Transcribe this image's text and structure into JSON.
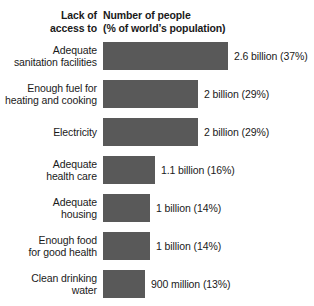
{
  "chart_data": {
    "type": "bar",
    "title": "",
    "orientation": "horizontal",
    "xlabel": "",
    "ylabel": "",
    "grid": false,
    "legend": null,
    "header_left_lines": [
      "Lack of",
      "access to"
    ],
    "header_right_lines": [
      "Number of people",
      "(% of world’s population)"
    ],
    "bar_color": "#595959",
    "background_color": "#ffffff",
    "xlim": [
      0,
      37
    ],
    "categories": [
      "Adequate sanitation facilities",
      "Enough fuel for heating and cooking",
      "Electricity",
      "Adequate health care",
      "Adequate housing",
      "Enough food for good health",
      "Clean drinking water"
    ],
    "values": [
      37,
      29,
      29,
      16,
      14,
      14,
      13
    ],
    "value_labels": [
      "2.6 billion (37%)",
      "2 billion (29%)",
      "2 billion (29%)",
      "1.1 billion (16%)",
      "1 billion (14%)",
      "1 billion (14%)",
      "900 million (13%)"
    ],
    "counts_billions": [
      2.6,
      2,
      2,
      1.1,
      1,
      1,
      0.9
    ]
  },
  "rows": [
    {
      "label_lines": [
        "Adequate",
        "sanitation facilities"
      ],
      "value": "2.6 billion (37%)",
      "percent": 37,
      "bar_width": 125,
      "value_left": 234
    },
    {
      "label_lines": [
        "Enough fuel for",
        "heating and cooking"
      ],
      "value": "2 billion (29%)",
      "percent": 29,
      "bar_width": 95,
      "value_left": 204
    },
    {
      "label_lines": [
        "Electricity"
      ],
      "value": "2 billion (29%)",
      "percent": 29,
      "bar_width": 95,
      "value_left": 204
    },
    {
      "label_lines": [
        "Adequate",
        "health care"
      ],
      "value": "1.1 billion (16%)",
      "percent": 16,
      "bar_width": 52,
      "value_left": 161
    },
    {
      "label_lines": [
        "Adequate",
        "housing"
      ],
      "value": "1 billion (14%)",
      "percent": 14,
      "bar_width": 47,
      "value_left": 156
    },
    {
      "label_lines": [
        "Enough food",
        "for good health"
      ],
      "value": "1 billion (14%)",
      "percent": 14,
      "bar_width": 47,
      "value_left": 156
    },
    {
      "label_lines": [
        "Clean drinking",
        "water"
      ],
      "value": "900 million (13%)",
      "percent": 13,
      "bar_width": 42,
      "value_left": 151
    }
  ]
}
